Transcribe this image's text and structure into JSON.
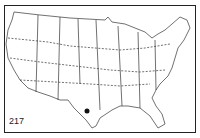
{
  "map": {
    "title": "United States outline map",
    "figure_number": "217",
    "marker": {
      "location": "South Texas",
      "x": 87,
      "y": 111,
      "color": "#111111"
    },
    "line_color": "#333333",
    "background": "#ffffff"
  }
}
